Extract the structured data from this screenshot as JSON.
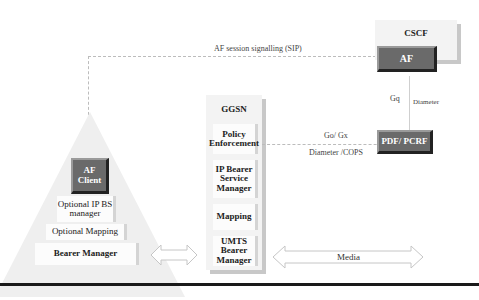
{
  "diagram": {
    "signalling_label": "AF session signalling (SIP)",
    "cscf": {
      "title": "CSCF",
      "af_label": "AF"
    },
    "gq": {
      "interface": "Gq",
      "protocol": "Diameter"
    },
    "pdf": {
      "label": "PDF/ PCRF"
    },
    "go": {
      "interface": "Go/ Gx",
      "protocol": "Diameter /COPS"
    },
    "ggsn": {
      "title": "GGSN",
      "cells": [
        "Policy Enforcement",
        "IP Bearer Service Manager",
        "Mapping",
        "UMTS Bearer Manager"
      ]
    },
    "ue": {
      "af_client": "AF Client",
      "cells": [
        "Optional IP BS manager",
        "Optional Mapping",
        "Bearer Manager"
      ]
    },
    "media_label": "Media",
    "colors": {
      "dark_box": "#6a6a6a",
      "panel": "#f3f3f3",
      "dashed_line": "#bcbcbc",
      "rule": "#1a1a1a"
    }
  }
}
